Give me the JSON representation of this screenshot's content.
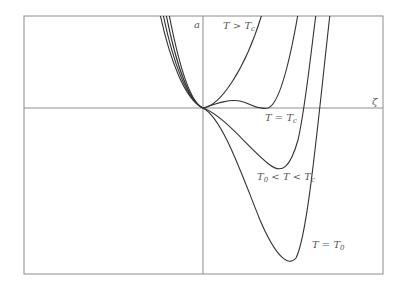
{
  "figure": {
    "axes": {
      "x_label": "ζ",
      "y_label": "a"
    },
    "labels": {
      "above_tc": {
        "main": "T > T",
        "sub": "c"
      },
      "equal_tc": {
        "main": "T = T",
        "sub": "c"
      },
      "between": {
        "pre": "T",
        "pre_sub": "0",
        "main": " < T < T",
        "sub": "c"
      },
      "equal_t0": {
        "main": "T = T",
        "sub": "0"
      }
    },
    "colors": {
      "frame": "#8c8c8c",
      "axis": "#8c8c8c",
      "curve": "#333333",
      "label": "#555555"
    }
  }
}
